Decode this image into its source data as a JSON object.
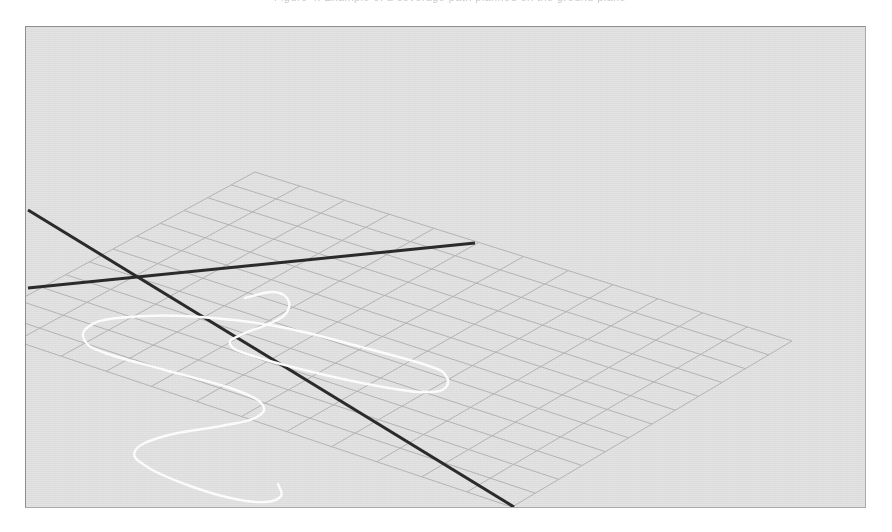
{
  "figure": {
    "clipped_caption": "Figure 4:  Example of a coverage path planned on the ground plane",
    "background_color": "#ffffff",
    "panel_color": "#e3e3e3",
    "frame_border_color": "#9b9b9b",
    "grid_color": "#b6b6b6",
    "axis_color": "#2b2b2b",
    "path_color": "#ffffff",
    "panel": {
      "x": 25,
      "y": 26,
      "width": 841,
      "height": 482
    }
  },
  "chart_data": {
    "type": "line",
    "title": "",
    "subtitle": "",
    "xlabel": "",
    "ylabel": "",
    "zlabel": "",
    "projection": "3d-perspective",
    "grid": true,
    "legend": null,
    "annotations": [],
    "ground_plane": {
      "description": "quadrilateral mesh ground plane drawn in perspective",
      "corner_points_px": [
        {
          "name": "top",
          "x": 230,
          "y": 146
        },
        {
          "name": "right",
          "x": 767,
          "y": 315
        },
        {
          "name": "bottom",
          "x": 487,
          "y": 481
        },
        {
          "name": "left",
          "x": -54,
          "y": 300
        }
      ],
      "cells_u": 12,
      "cells_v": 12,
      "line_color": "#b6b6b6",
      "line_width": 1
    },
    "axes_lines": [
      {
        "name": "axis-line-ne",
        "from_px": {
          "x": 3,
          "y": 262
        },
        "to_px": {
          "x": 450,
          "y": 217
        },
        "color": "#2b2b2b",
        "width": 3,
        "note": "ascending axis, ends inside plane"
      },
      {
        "name": "axis-line-se",
        "from_px": {
          "x": 3,
          "y": 184
        },
        "to_px": {
          "x": 489,
          "y": 481
        },
        "color": "#2b2b2b",
        "width": 3,
        "note": "descending axis, runs to bottom frame edge"
      }
    ],
    "axes_origin_px": {
      "x": 237,
      "y": 358
    },
    "series": [
      {
        "name": "coverage-path",
        "type": "boustrophedon",
        "color": "#ffffff",
        "width": 2.4,
        "closed": false,
        "sweeps": 4,
        "points_px": [
          {
            "x": 220,
            "y": 272
          },
          {
            "x": 247,
            "y": 266
          },
          {
            "x": 262,
            "y": 272
          },
          {
            "x": 262,
            "y": 286
          },
          {
            "x": 246,
            "y": 297
          },
          {
            "x": 218,
            "y": 308
          },
          {
            "x": 205,
            "y": 318
          },
          {
            "x": 228,
            "y": 330
          },
          {
            "x": 300,
            "y": 349
          },
          {
            "x": 370,
            "y": 363
          },
          {
            "x": 404,
            "y": 366
          },
          {
            "x": 420,
            "y": 362
          },
          {
            "x": 421,
            "y": 350
          },
          {
            "x": 404,
            "y": 340
          },
          {
            "x": 340,
            "y": 322
          },
          {
            "x": 250,
            "y": 300
          },
          {
            "x": 160,
            "y": 290
          },
          {
            "x": 92,
            "y": 292
          },
          {
            "x": 63,
            "y": 301
          },
          {
            "x": 60,
            "y": 315
          },
          {
            "x": 80,
            "y": 327
          },
          {
            "x": 140,
            "y": 344
          },
          {
            "x": 205,
            "y": 362
          },
          {
            "x": 237,
            "y": 378
          },
          {
            "x": 230,
            "y": 392
          },
          {
            "x": 196,
            "y": 400
          },
          {
            "x": 140,
            "y": 410
          },
          {
            "x": 110,
            "y": 425
          },
          {
            "x": 124,
            "y": 442
          },
          {
            "x": 168,
            "y": 461
          },
          {
            "x": 210,
            "y": 473
          },
          {
            "x": 241,
            "y": 476
          },
          {
            "x": 256,
            "y": 470
          },
          {
            "x": 253,
            "y": 458
          }
        ]
      }
    ]
  }
}
